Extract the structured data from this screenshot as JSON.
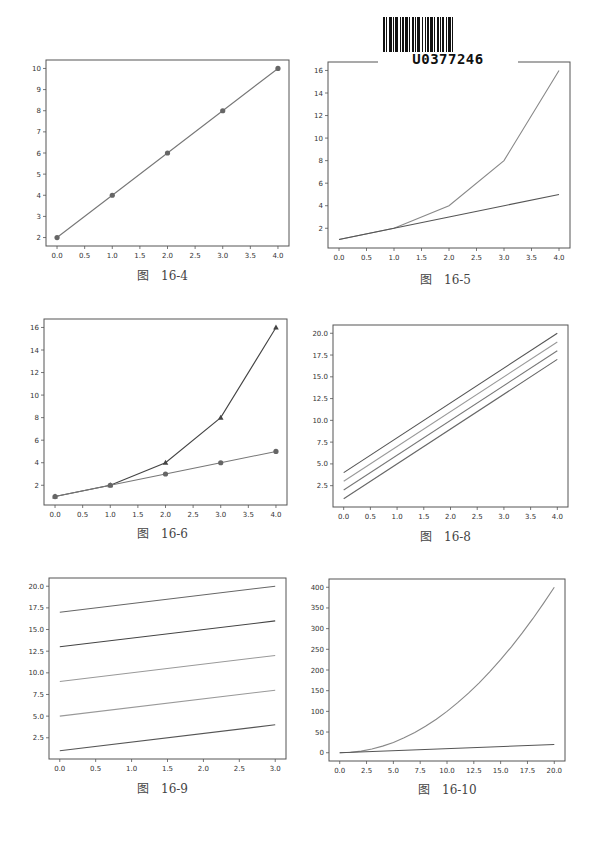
{
  "barcode": {
    "text": "U0377246"
  },
  "chart_data": [
    {
      "id": "fig-16-4",
      "caption": "图　16-4",
      "type": "line",
      "title": "",
      "xlabel": "",
      "ylabel": "",
      "grid": false,
      "xlim": [
        -0.2,
        4.2
      ],
      "ylim": [
        1.6,
        10.4
      ],
      "xticks": [
        0.0,
        0.5,
        1.0,
        1.5,
        2.0,
        2.5,
        3.0,
        3.5,
        4.0
      ],
      "xtick_labels": [
        "0.0",
        "0.5",
        "1.0",
        "1.5",
        "2.0",
        "2.5",
        "3.0",
        "3.5",
        "4.0"
      ],
      "yticks": [
        2,
        3,
        4,
        5,
        6,
        7,
        8,
        9,
        10
      ],
      "ytick_labels": [
        "2",
        "3",
        "4",
        "5",
        "6",
        "7",
        "8",
        "9",
        "10"
      ],
      "series": [
        {
          "name": "line",
          "x": [
            0,
            1,
            2,
            3,
            4
          ],
          "y": [
            2,
            4,
            6,
            8,
            10
          ],
          "color": "#777777",
          "marker": "circle"
        }
      ]
    },
    {
      "id": "fig-16-5",
      "caption": "图　16-5",
      "type": "line",
      "title": "",
      "xlabel": "",
      "ylabel": "",
      "grid": false,
      "xlim": [
        -0.2,
        4.2
      ],
      "ylim": [
        0.25,
        16.75
      ],
      "xticks": [
        0.0,
        0.5,
        1.0,
        1.5,
        2.0,
        2.5,
        3.0,
        3.5,
        4.0
      ],
      "xtick_labels": [
        "0.0",
        "0.5",
        "1.0",
        "1.5",
        "2.0",
        "2.5",
        "3.0",
        "3.5",
        "4.0"
      ],
      "yticks": [
        2,
        4,
        6,
        8,
        10,
        12,
        14,
        16
      ],
      "ytick_labels": [
        "2",
        "4",
        "6",
        "8",
        "10",
        "12",
        "14",
        "16"
      ],
      "series": [
        {
          "name": "exponential",
          "x": [
            0,
            1,
            2,
            3,
            4
          ],
          "y": [
            1,
            2,
            4,
            8,
            16
          ],
          "color": "#888888",
          "marker": "none"
        },
        {
          "name": "linear",
          "x": [
            0,
            1,
            2,
            3,
            4
          ],
          "y": [
            1,
            2,
            3,
            4,
            5
          ],
          "color": "#555555",
          "marker": "none"
        }
      ]
    },
    {
      "id": "fig-16-6",
      "caption": "图　16-6",
      "type": "line",
      "title": "",
      "xlabel": "",
      "ylabel": "",
      "grid": false,
      "xlim": [
        -0.2,
        4.2
      ],
      "ylim": [
        0.25,
        16.75
      ],
      "xticks": [
        0.0,
        0.5,
        1.0,
        1.5,
        2.0,
        2.5,
        3.0,
        3.5,
        4.0
      ],
      "xtick_labels": [
        "0.0",
        "0.5",
        "1.0",
        "1.5",
        "2.0",
        "2.5",
        "3.0",
        "3.5",
        "4.0"
      ],
      "yticks": [
        2,
        4,
        6,
        8,
        10,
        12,
        14,
        16
      ],
      "ytick_labels": [
        "2",
        "4",
        "6",
        "8",
        "10",
        "12",
        "14",
        "16"
      ],
      "series": [
        {
          "name": "exponential",
          "x": [
            0,
            1,
            2,
            3,
            4
          ],
          "y": [
            1,
            2,
            4,
            8,
            16
          ],
          "color": "#444444",
          "marker": "triangle"
        },
        {
          "name": "linear",
          "x": [
            0,
            1,
            2,
            3,
            4
          ],
          "y": [
            1,
            2,
            3,
            4,
            5
          ],
          "color": "#777777",
          "marker": "circle"
        }
      ]
    },
    {
      "id": "fig-16-8",
      "caption": "图　16-8",
      "type": "line",
      "title": "",
      "xlabel": "",
      "ylabel": "",
      "grid": false,
      "xlim": [
        -0.2,
        4.2
      ],
      "ylim": [
        0.05,
        20.95
      ],
      "xticks": [
        0.0,
        0.5,
        1.0,
        1.5,
        2.0,
        2.5,
        3.0,
        3.5,
        4.0
      ],
      "xtick_labels": [
        "0.0",
        "0.5",
        "1.0",
        "1.5",
        "2.0",
        "2.5",
        "3.0",
        "3.5",
        "4.0"
      ],
      "yticks": [
        2.5,
        5.0,
        7.5,
        10.0,
        12.5,
        15.0,
        17.5,
        20.0
      ],
      "ytick_labels": [
        "2.5",
        "5.0",
        "7.5",
        "10.0",
        "12.5",
        "15.0",
        "17.5",
        "20.0"
      ],
      "series": [
        {
          "name": "y=4x+1",
          "x": [
            0,
            4
          ],
          "y": [
            1,
            17
          ],
          "color": "#666666",
          "marker": "none"
        },
        {
          "name": "y=4x+2",
          "x": [
            0,
            4
          ],
          "y": [
            2,
            18
          ],
          "color": "#777777",
          "marker": "none"
        },
        {
          "name": "y=4x+3",
          "x": [
            0,
            4
          ],
          "y": [
            3,
            19
          ],
          "color": "#999999",
          "marker": "none"
        },
        {
          "name": "y=4x+4",
          "x": [
            0,
            4
          ],
          "y": [
            4,
            20
          ],
          "color": "#555555",
          "marker": "none"
        }
      ]
    },
    {
      "id": "fig-16-9",
      "caption": "图　16-9",
      "type": "line",
      "title": "",
      "xlabel": "",
      "ylabel": "",
      "grid": false,
      "xlim": [
        -0.15,
        3.15
      ],
      "ylim": [
        0.05,
        20.95
      ],
      "xticks": [
        0.0,
        0.5,
        1.0,
        1.5,
        2.0,
        2.5,
        3.0
      ],
      "xtick_labels": [
        "0.0",
        "0.5",
        "1.0",
        "1.5",
        "2.0",
        "2.5",
        "3.0"
      ],
      "yticks": [
        2.5,
        5.0,
        7.5,
        10.0,
        12.5,
        15.0,
        17.5,
        20.0
      ],
      "ytick_labels": [
        "2.5",
        "5.0",
        "7.5",
        "10.0",
        "12.5",
        "15.0",
        "17.5",
        "20.0"
      ],
      "series": [
        {
          "name": "line1",
          "x": [
            0,
            3
          ],
          "y": [
            1,
            4
          ],
          "color": "#555555",
          "marker": "none"
        },
        {
          "name": "line2",
          "x": [
            0,
            3
          ],
          "y": [
            5,
            8
          ],
          "color": "#999999",
          "marker": "none"
        },
        {
          "name": "line3",
          "x": [
            0,
            3
          ],
          "y": [
            9,
            12
          ],
          "color": "#999999",
          "marker": "none"
        },
        {
          "name": "line4",
          "x": [
            0,
            3
          ],
          "y": [
            13,
            16
          ],
          "color": "#444444",
          "marker": "none"
        },
        {
          "name": "line5",
          "x": [
            0,
            3
          ],
          "y": [
            17,
            20
          ],
          "color": "#666666",
          "marker": "none"
        }
      ]
    },
    {
      "id": "fig-16-10",
      "caption": "图　16-10",
      "type": "line",
      "title": "",
      "xlabel": "",
      "ylabel": "",
      "grid": false,
      "xlim": [
        -1.0,
        21.0
      ],
      "ylim": [
        -20,
        420
      ],
      "xticks": [
        0.0,
        2.5,
        5.0,
        7.5,
        10.0,
        12.5,
        15.0,
        17.5,
        20.0
      ],
      "xtick_labels": [
        "0.0",
        "2.5",
        "5.0",
        "7.5",
        "10.0",
        "12.5",
        "15.0",
        "17.5",
        "20.0"
      ],
      "yticks": [
        0,
        50,
        100,
        150,
        200,
        250,
        300,
        350,
        400
      ],
      "ytick_labels": [
        "0",
        "50",
        "100",
        "150",
        "200",
        "250",
        "300",
        "350",
        "400"
      ],
      "series": [
        {
          "name": "y=x^2",
          "x": [
            0,
            1,
            2,
            3,
            4,
            5,
            6,
            7,
            8,
            9,
            10,
            11,
            12,
            13,
            14,
            15,
            16,
            17,
            18,
            19,
            20
          ],
          "y": [
            0,
            1,
            4,
            9,
            16,
            25,
            36,
            49,
            64,
            81,
            100,
            121,
            144,
            169,
            196,
            225,
            256,
            289,
            324,
            361,
            400
          ],
          "color": "#888888",
          "marker": "none"
        },
        {
          "name": "y=x",
          "x": [
            0,
            20
          ],
          "y": [
            0,
            20
          ],
          "color": "#555555",
          "marker": "none"
        }
      ]
    }
  ],
  "layout_frames": {
    "fig-16-4": {
      "left": 46,
      "top": 60,
      "right": 289,
      "bottom": 246,
      "caption_x": 137,
      "caption_y": 266
    },
    "fig-16-5": {
      "left": 328,
      "top": 62,
      "right": 570,
      "bottom": 248,
      "caption_x": 420,
      "caption_y": 270
    },
    "fig-16-6": {
      "left": 44,
      "top": 319,
      "right": 287,
      "bottom": 505,
      "caption_x": 137,
      "caption_y": 524
    },
    "fig-16-8": {
      "left": 333,
      "top": 325,
      "right": 568,
      "bottom": 507,
      "caption_x": 420,
      "caption_y": 527
    },
    "fig-16-9": {
      "left": 49,
      "top": 578,
      "right": 286,
      "bottom": 759,
      "caption_x": 137,
      "caption_y": 779
    },
    "fig-16-10": {
      "left": 329,
      "top": 579,
      "right": 565,
      "bottom": 761,
      "caption_x": 418,
      "caption_y": 780
    }
  }
}
